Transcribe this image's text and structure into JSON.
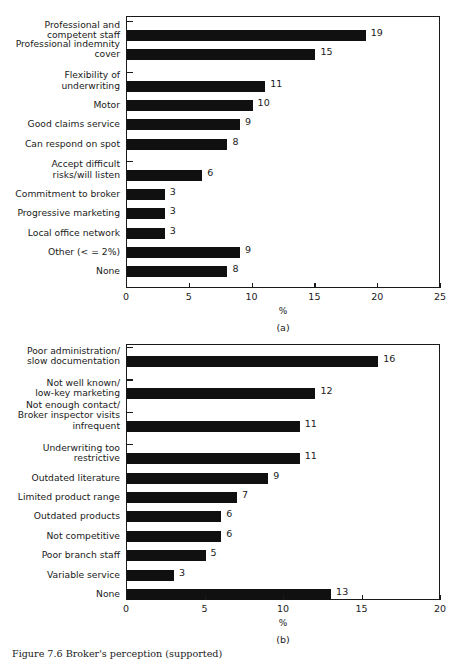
{
  "figure": {
    "caption": "Figure 7.6  Broker's perception (supported)",
    "panel_a_tag": "(a)",
    "panel_b_tag": "(b)"
  },
  "chart_data": [
    {
      "type": "bar",
      "orientation": "horizontal",
      "panel": "(a)",
      "title": "",
      "xlabel": "%",
      "ylabel": "",
      "xlim": [
        0,
        25
      ],
      "xticks": [
        0,
        5,
        10,
        15,
        20,
        25
      ],
      "grid": false,
      "legend": false,
      "categories": [
        "Professional and\ncompetent staff",
        "Professional indemnity\ncover",
        "Flexibility of\nunderwriting",
        "Motor",
        "Good claims service",
        "Can respond on spot",
        "Accept difficult\nrisks/will listen",
        "Commitment to broker",
        "Progressive marketing",
        "Local office network",
        "Other (< = 2%)",
        "None"
      ],
      "values": [
        19,
        15,
        11,
        10,
        9,
        8,
        6,
        3,
        3,
        3,
        9,
        8
      ],
      "group_breaks_after": [
        1,
        5
      ]
    },
    {
      "type": "bar",
      "orientation": "horizontal",
      "panel": "(b)",
      "title": "",
      "xlabel": "%",
      "ylabel": "",
      "xlim": [
        0,
        20
      ],
      "xticks": [
        0,
        5,
        10,
        15,
        20
      ],
      "grid": false,
      "legend": false,
      "categories": [
        "Poor administration/\nslow documentation",
        "Not well known/\nlow-key marketing",
        "Not enough contact/\nBroker inspector visits\ninfrequent",
        "Underwriting too\nrestrictive",
        "Outdated literature",
        "Limited product range",
        "Outdated products",
        "Not competitive",
        "Poor branch staff",
        "Variable service",
        "None"
      ],
      "values": [
        16,
        12,
        11,
        11,
        9,
        7,
        6,
        6,
        5,
        3,
        13
      ],
      "group_breaks_after": [
        0,
        1,
        2
      ]
    }
  ],
  "colors": {
    "bar": "#101010",
    "axis": "#1a1a1a",
    "background": "#ffffff"
  }
}
